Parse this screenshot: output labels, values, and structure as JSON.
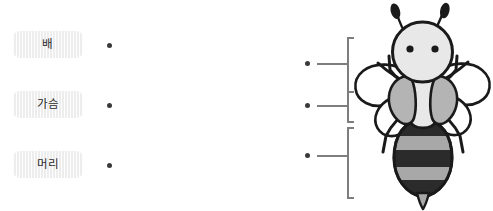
{
  "diagram": {
    "kind": "matching-diagram",
    "labels": [
      {
        "id": "abdomen",
        "text": "배",
        "dot_icon": "connector-dot"
      },
      {
        "id": "thorax",
        "text": "가슴",
        "dot_icon": "connector-dot"
      },
      {
        "id": "head",
        "text": "머리",
        "dot_icon": "connector-dot"
      }
    ],
    "connectors": [
      {
        "id": "connector-head",
        "target": "head",
        "dot_icon": "connector-dot",
        "bracket_icon": "bracket-line"
      },
      {
        "id": "connector-thorax",
        "target": "thorax",
        "dot_icon": "connector-dot",
        "bracket_icon": "bracket-line"
      },
      {
        "id": "connector-abdomen",
        "target": "abdomen",
        "dot_icon": "connector-dot",
        "bracket_icon": "bracket-line"
      }
    ],
    "illustration": {
      "name": "bee-illustration",
      "parts": [
        "antenna-left",
        "antenna-right",
        "head",
        "eye-left",
        "eye-right",
        "wing-upper-left",
        "wing-lower-left",
        "wing-upper-right",
        "wing-lower-right",
        "leg-left-front",
        "leg-left-middle",
        "leg-left-rear",
        "leg-right-front",
        "leg-right-middle",
        "leg-right-rear",
        "thorax",
        "thorax-fur-left",
        "thorax-fur-right",
        "abdomen",
        "abdomen-stripes",
        "stinger"
      ]
    },
    "colors": {
      "chip_background": "#f1f1f1",
      "chip_text": "#2b2b2b",
      "dot": "#3a3a3a",
      "bracket": "#7e7e7e",
      "outline": "#1a1a1a",
      "body_light": "#e8e8e8",
      "body_mid": "#a8a8a8",
      "body_dark": "#2b2b2b",
      "wing": "#ffffff",
      "page_background": "#ffffff"
    }
  }
}
